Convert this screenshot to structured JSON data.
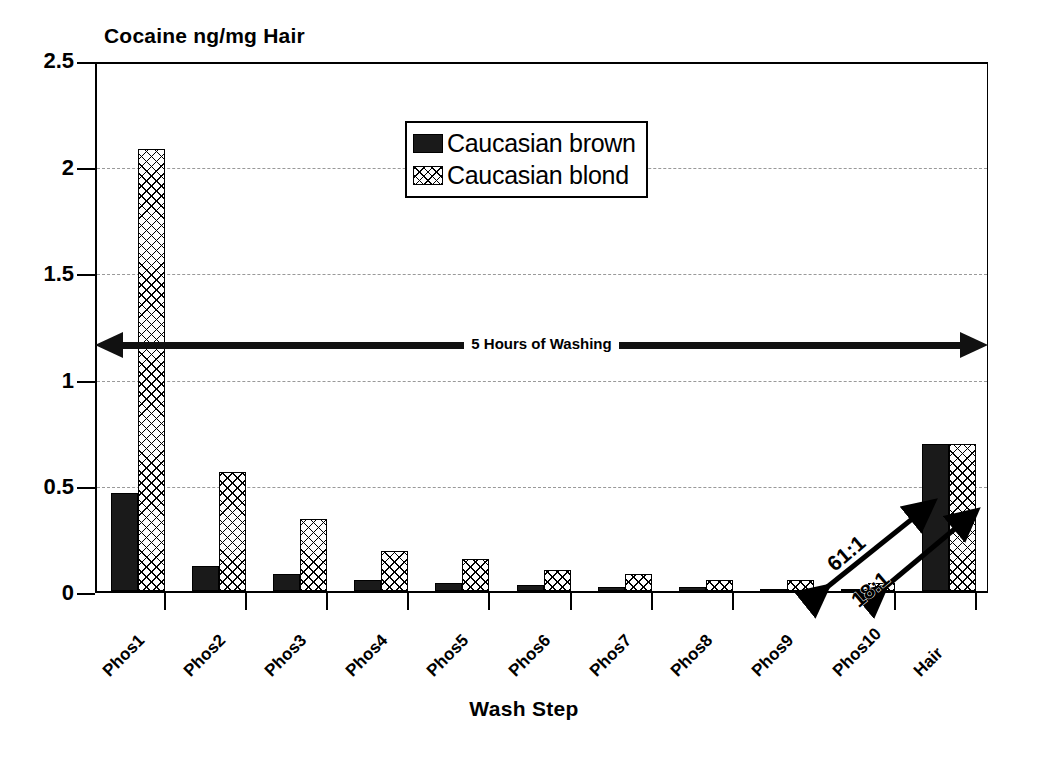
{
  "chart_data": {
    "type": "bar",
    "title": "Cocaine ng/mg Hair",
    "xlabel": "Wash Step",
    "ylabel": "",
    "ylim": [
      0,
      2.5
    ],
    "yticks": [
      "0",
      "0.5",
      "1",
      "1.5",
      "2",
      "2.5"
    ],
    "ytick_values": [
      0,
      0.5,
      1,
      1.5,
      2,
      2.5
    ],
    "grid": "horizontal dashed",
    "legend_position": "upper center",
    "categories": [
      "Phos1",
      "Phos2",
      "Phos3",
      "Phos4",
      "Phos5",
      "Phos6",
      "Phos7",
      "Phos8",
      "Phos9",
      "Phos10",
      "Hair"
    ],
    "series": [
      {
        "name": "Caucasian brown",
        "fill": "solid-black",
        "values": [
          0.46,
          0.12,
          0.08,
          0.05,
          0.04,
          0.03,
          0.02,
          0.02,
          0.01,
          0.01,
          0.69
        ]
      },
      {
        "name": "Caucasian blond",
        "fill": "crosshatch",
        "values": [
          2.08,
          0.56,
          0.34,
          0.19,
          0.15,
          0.1,
          0.08,
          0.05,
          0.05,
          0.04,
          0.69
        ]
      }
    ],
    "annotations": [
      {
        "id": "washing-span",
        "text": "5 Hours of Washing",
        "style": "double-headed-arrow",
        "spans": "Phos1 to Hair"
      },
      {
        "id": "ratio-brown",
        "text": "61:1",
        "style": "double-headed-arrow",
        "from": "Phos10 brown",
        "to": "Hair brown"
      },
      {
        "id": "ratio-blond",
        "text": "18:1",
        "style": "double-headed-arrow",
        "from": "Phos10 blond",
        "to": "Hair blond"
      }
    ]
  },
  "colors": {
    "brown_series": "#1a1a1a",
    "blond_series": "#ffffff",
    "axis": "#000000",
    "grid": "#999999",
    "background": "#ffffff"
  },
  "legend": {
    "items": [
      {
        "label": "Caucasian brown",
        "swatch": "solid-black"
      },
      {
        "label": "Caucasian blond",
        "swatch": "crosshatch"
      }
    ]
  }
}
